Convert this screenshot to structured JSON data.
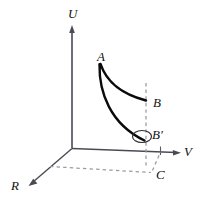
{
  "figure": {
    "background_color": "#ffffff",
    "stroke_color": "#2b2b2b",
    "curve_color": "#0a0a0a",
    "dash_color": "#8a8a95",
    "axes": [
      {
        "id": "U",
        "label": "U",
        "direction": "up",
        "name": "u-axis"
      },
      {
        "id": "V",
        "label": "V",
        "direction": "right",
        "name": "v-axis"
      },
      {
        "id": "R",
        "label": "R",
        "direction": "down-left",
        "name": "r-axis"
      }
    ],
    "points": [
      {
        "id": "A",
        "label": "A",
        "name": "point-a"
      },
      {
        "id": "B",
        "label": "B",
        "name": "point-b"
      },
      {
        "id": "Bp",
        "label": "B′",
        "name": "point-b-prime"
      },
      {
        "id": "C",
        "label": "C",
        "name": "point-c"
      }
    ],
    "curves": [
      {
        "id": "upper-curve",
        "from": "A",
        "to": "B"
      },
      {
        "id": "lower-curve",
        "from": "A",
        "to": "B′"
      }
    ],
    "markers": [
      {
        "id": "b-prime-ellipse",
        "shape": "ellipse",
        "name": "b-prime-ellipse"
      }
    ],
    "guides": [
      {
        "id": "vertical-dashed",
        "from": "B",
        "to": "C"
      },
      {
        "id": "base-dashed",
        "from": "R-axis",
        "to": "C"
      },
      {
        "id": "c-to-v-dashed",
        "from": "C",
        "to": "V-axis-tick"
      }
    ]
  }
}
